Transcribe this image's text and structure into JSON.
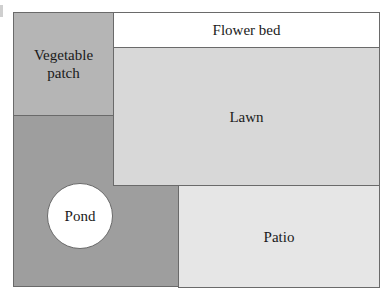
{
  "diagram": {
    "type": "garden-layout-plan",
    "regions": [
      {
        "id": "vegetable-patch",
        "label": "Vegetable\npatch",
        "color": "#b5b5b5"
      },
      {
        "id": "flower-bed",
        "label": "Flower bed",
        "color": "#ffffff"
      },
      {
        "id": "lawn",
        "label": "Lawn",
        "color": "#d8d8d8"
      },
      {
        "id": "pond",
        "label": "Pond",
        "color": "#ffffff"
      },
      {
        "id": "patio",
        "label": "Patio",
        "color": "#e6e6e6"
      },
      {
        "id": "garden-ground",
        "label": "",
        "color": "#9e9e9e"
      }
    ],
    "border_color": "#6a6a6a"
  }
}
